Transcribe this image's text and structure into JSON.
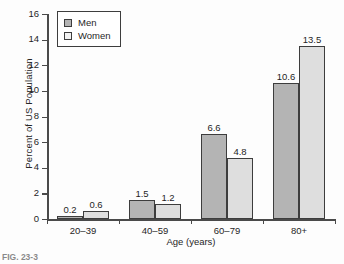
{
  "chart_data": {
    "type": "bar",
    "title": "",
    "xlabel": "Age (years)",
    "ylabel": "Percent of US Population",
    "categories": [
      "20–39",
      "40–59",
      "60–79",
      "80+"
    ],
    "series": [
      {
        "name": "Men",
        "color": "#b4b4b4",
        "values": [
          0.2,
          1.5,
          6.6,
          10.6
        ]
      },
      {
        "name": "Women",
        "color": "#dedede",
        "values": [
          0.6,
          1.2,
          4.8,
          13.5
        ]
      }
    ],
    "ylim": [
      0,
      16
    ],
    "yticks": [
      0,
      2,
      4,
      6,
      8,
      10,
      12,
      14,
      16
    ],
    "ytick_labels": [
      "0",
      "2",
      "4",
      "6",
      "8",
      "10",
      "12",
      "14",
      "16"
    ],
    "grid": false,
    "legend_position": "top-left",
    "data_labels": [
      "0.2",
      "0.6",
      "1.5",
      "1.2",
      "6.6",
      "4.8",
      "10.6",
      "13.5"
    ]
  },
  "legend": {
    "entries": [
      {
        "label": "Men"
      },
      {
        "label": "Women"
      }
    ]
  },
  "caption": {
    "text": "FIG. 23-3"
  }
}
